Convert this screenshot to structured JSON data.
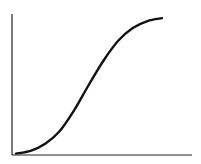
{
  "chart_data": {
    "type": "line",
    "title": "",
    "xlabel": "",
    "ylabel": "",
    "grid": false,
    "legend": null,
    "x": [
      0,
      0.1,
      0.2,
      0.3,
      0.4,
      0.5,
      0.6,
      0.7,
      0.8,
      0.9,
      1.0
    ],
    "values": [
      0.01,
      0.03,
      0.08,
      0.17,
      0.32,
      0.5,
      0.67,
      0.81,
      0.9,
      0.95,
      0.97
    ],
    "xlim": [
      0,
      1.2
    ],
    "ylim": [
      0,
      1.0
    ],
    "line_color": "#111111",
    "axis_color": "#222222"
  }
}
